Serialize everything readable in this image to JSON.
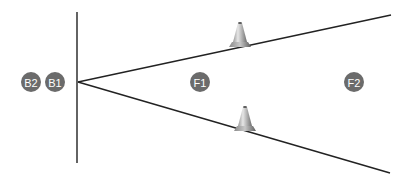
{
  "diagram": {
    "colors": {
      "line": "#222222",
      "badge_fill": "#6b6b6b",
      "badge_text": "#ffffff",
      "cone_light": "#d8d8d8",
      "cone_dark": "#777777"
    },
    "vertical_line": {
      "x": 77,
      "y1": 12,
      "y2": 163
    },
    "vertex": {
      "x": 78,
      "y": 82
    },
    "rays": [
      {
        "name": "upper",
        "x2": 391,
        "y2": 15
      },
      {
        "name": "lower",
        "x2": 390,
        "y2": 173
      }
    ],
    "badges": [
      {
        "id": "B2",
        "label": "B2",
        "cx": 31,
        "cy": 82
      },
      {
        "id": "B1",
        "label": "B1",
        "cx": 55,
        "cy": 82
      },
      {
        "id": "F1",
        "label": "F1",
        "cx": 200,
        "cy": 82
      },
      {
        "id": "F2",
        "label": "F2",
        "cx": 354,
        "cy": 82
      }
    ],
    "cones": [
      {
        "name": "upper-cone",
        "x": 240,
        "base_y": 47
      },
      {
        "name": "lower-cone",
        "x": 245,
        "base_y": 131
      }
    ]
  }
}
